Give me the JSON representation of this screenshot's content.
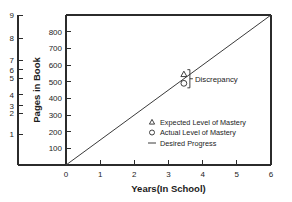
{
  "chart_data": {
    "type": "line",
    "title": "",
    "xlabel": "Years(In School)",
    "ylabel_left": "Levels in Curriculum",
    "ylabel_right": "Pages in Book",
    "xlim": [
      0,
      6
    ],
    "xticks": [
      0,
      1,
      2,
      3,
      4,
      5,
      6
    ],
    "xticklabels": [
      "0",
      "1",
      "2",
      "3",
      "4",
      "5",
      "6"
    ],
    "ylim_pages": [
      0,
      900
    ],
    "yticks_pages": [
      100,
      200,
      300,
      400,
      500,
      600,
      700,
      800
    ],
    "yticklabels_pages": [
      "100",
      "200",
      "300",
      "400",
      "500",
      "600",
      "700",
      "800"
    ],
    "ylim_levels": [
      0,
      9
    ],
    "yticks_levels": [
      1,
      2,
      3,
      4,
      5,
      6,
      7,
      8,
      9
    ],
    "yticklabels_levels": [
      "1",
      "2",
      "3",
      "4",
      "5",
      "6",
      "7",
      "8",
      "9"
    ],
    "grid": false,
    "legend_position": "inside lower right",
    "series": [
      {
        "name": "Desired Progress",
        "marker": "line",
        "x": [
          0,
          6
        ],
        "y": [
          0,
          900
        ]
      },
      {
        "name": "Expected Level of Mastery",
        "marker": "triangle",
        "x": [
          3.45
        ],
        "y": [
          545
        ]
      },
      {
        "name": "Actual Level of Mastery",
        "marker": "circle",
        "x": [
          3.45
        ],
        "y": [
          490
        ]
      }
    ],
    "annotations": [
      {
        "text": "Discrepancy",
        "x": 3.75,
        "y": 517,
        "kind": "bracket-label"
      }
    ]
  },
  "legend": {
    "entries": [
      {
        "symbol": "triangle",
        "label": "Expected Level of Mastery"
      },
      {
        "symbol": "circle",
        "label": "Actual Level of Mastery"
      },
      {
        "symbol": "line",
        "label": "Desired Progress"
      }
    ]
  },
  "axes": {
    "x_title": "Years(In School)",
    "y_left_title": "Levels in Curriculum",
    "y_right_title": "Pages in Book"
  },
  "annotation": {
    "discrepancy_label": "Discrepancy"
  },
  "colors": {
    "ink": "#1c1c1c",
    "line": "#3a3a3a",
    "background": "#ffffff"
  }
}
